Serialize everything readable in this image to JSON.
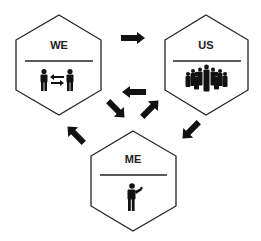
{
  "diagram": {
    "nodes": [
      {
        "id": "we",
        "label": "WE",
        "icon": "two-people-exchange-icon"
      },
      {
        "id": "us",
        "label": "US",
        "icon": "group-of-people-icon"
      },
      {
        "id": "me",
        "label": "ME",
        "icon": "person-presenting-icon"
      }
    ],
    "edges": [
      {
        "from": "WE",
        "to": "US"
      },
      {
        "from": "US",
        "to": "ME"
      },
      {
        "from": "ME",
        "to": "WE"
      },
      {
        "from": "center",
        "to": "WE",
        "note": "inner left arrow"
      },
      {
        "from": "center",
        "to": "ME",
        "note": "inner down-right arrow"
      },
      {
        "from": "ME",
        "to": "US",
        "note": "inner up-right arrow"
      }
    ],
    "colors": {
      "stroke": "#222222",
      "fill": "#ffffff",
      "icon": "#111111"
    }
  }
}
